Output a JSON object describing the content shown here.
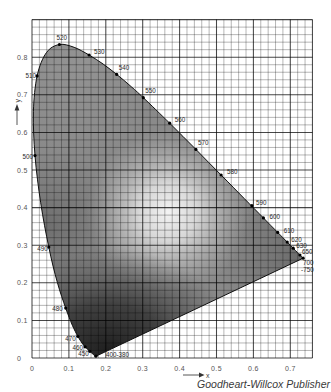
{
  "figure": {
    "credit": "Goodheart-Willcox Publisher"
  },
  "chart_data": {
    "type": "line",
    "title": "",
    "xlabel": "x",
    "ylabel": "y",
    "xlim": [
      0,
      0.76
    ],
    "ylim": [
      0,
      0.9
    ],
    "xticks": [
      0,
      0.1,
      0.2,
      0.3,
      0.4,
      0.5,
      0.6,
      0.7
    ],
    "xtick_labels": [
      "0",
      "0.1",
      "0.2",
      "0.3",
      "0.4",
      "0.5",
      "0.6",
      "0.7"
    ],
    "yticks": [
      0,
      0.1,
      0.2,
      0.3,
      0.4,
      0.5,
      0.6,
      0.7,
      0.8
    ],
    "ytick_labels": [
      "0",
      "0.1",
      "0.2",
      "0.3",
      "0.4",
      "0.5",
      "0.6",
      "0.7",
      "0.8"
    ],
    "grid": {
      "on": true,
      "minor_step": 0.02,
      "major_step": 0.1
    },
    "legend": null,
    "colors": {
      "fill_base": "#8a8a8a",
      "fill_light_center": "#f4f4f4",
      "fill_dark_bottom": "#1c1c1c",
      "locus_line": "#111111",
      "marker": "#000000",
      "background": "#ffffff"
    },
    "series": [
      {
        "name": "spectral locus",
        "closed": true,
        "wavelengths_nm": [
          380,
          420,
          430,
          440,
          450,
          455,
          460,
          465,
          470,
          475,
          480,
          485,
          490,
          495,
          500,
          505,
          510,
          515,
          520,
          525,
          530,
          535,
          540,
          545,
          550,
          560,
          570,
          580,
          590,
          600,
          610,
          620,
          630,
          640,
          650,
          700
        ],
        "x": [
          0.1741,
          0.1714,
          0.1689,
          0.1644,
          0.1566,
          0.151,
          0.144,
          0.1355,
          0.1241,
          0.1096,
          0.0913,
          0.0687,
          0.0454,
          0.0235,
          0.0082,
          0.0039,
          0.0139,
          0.0389,
          0.0743,
          0.1142,
          0.1547,
          0.1929,
          0.2296,
          0.2658,
          0.3016,
          0.3731,
          0.4441,
          0.5125,
          0.5752,
          0.627,
          0.6658,
          0.6915,
          0.7079,
          0.719,
          0.726,
          0.7347
        ],
        "y": [
          0.005,
          0.0051,
          0.0069,
          0.0109,
          0.0177,
          0.0227,
          0.0297,
          0.0399,
          0.0578,
          0.0868,
          0.1327,
          0.2007,
          0.295,
          0.4127,
          0.5384,
          0.6548,
          0.7502,
          0.812,
          0.8338,
          0.8262,
          0.8059,
          0.7816,
          0.7543,
          0.7243,
          0.6923,
          0.6245,
          0.5547,
          0.4866,
          0.4242,
          0.3725,
          0.334,
          0.3083,
          0.292,
          0.2809,
          0.274,
          0.2653
        ]
      }
    ],
    "markers": [
      {
        "label": "400-380",
        "x": 0.1733,
        "y": 0.0048,
        "dx": 10,
        "dy": 0.5,
        "anchor": "start"
      },
      {
        "label": "450",
        "x": 0.1566,
        "y": 0.0177,
        "dx": -1,
        "dy": 5,
        "anchor": "end"
      },
      {
        "label": "460",
        "x": 0.144,
        "y": 0.0297,
        "dx": -2,
        "dy": 3,
        "anchor": "end"
      },
      {
        "label": "470",
        "x": 0.1241,
        "y": 0.0578,
        "dx": -2,
        "dy": 5,
        "anchor": "end"
      },
      {
        "label": "480",
        "x": 0.0913,
        "y": 0.1327,
        "dx": -3,
        "dy": 3,
        "anchor": "end"
      },
      {
        "label": "490",
        "x": 0.0454,
        "y": 0.295,
        "dx": -1,
        "dy": 4,
        "anchor": "end"
      },
      {
        "label": "500",
        "x": 0.0082,
        "y": 0.5384,
        "dx": -2,
        "dy": 3.5,
        "anchor": "end"
      },
      {
        "label": "510",
        "x": 0.0139,
        "y": 0.7502,
        "dx": -1,
        "dy": 2,
        "anchor": "end"
      },
      {
        "label": "520",
        "x": 0.0743,
        "y": 0.8338,
        "dx": -3,
        "dy": -5,
        "anchor": "start"
      },
      {
        "label": "530",
        "x": 0.1547,
        "y": 0.8059,
        "dx": 5,
        "dy": -1,
        "anchor": "start"
      },
      {
        "label": "540",
        "x": 0.2296,
        "y": 0.7543,
        "dx": 2,
        "dy": -4,
        "anchor": "start"
      },
      {
        "label": "550",
        "x": 0.3016,
        "y": 0.6923,
        "dx": 2,
        "dy": -5,
        "anchor": "start"
      },
      {
        "label": "560",
        "x": 0.3731,
        "y": 0.6245,
        "dx": 5,
        "dy": -1,
        "anchor": "start"
      },
      {
        "label": "570",
        "x": 0.4441,
        "y": 0.5547,
        "dx": 2,
        "dy": -4,
        "anchor": "start"
      },
      {
        "label": "580",
        "x": 0.5125,
        "y": 0.4866,
        "dx": 6,
        "dy": -1,
        "anchor": "start"
      },
      {
        "label": "590",
        "x": 0.596,
        "y": 0.405,
        "dx": 4,
        "dy": -1,
        "anchor": "start"
      },
      {
        "label": "600",
        "x": 0.627,
        "y": 0.3725,
        "dx": 6,
        "dy": 1,
        "anchor": "start"
      },
      {
        "label": "610",
        "x": 0.6658,
        "y": 0.334,
        "dx": 6,
        "dy": 1,
        "anchor": "start"
      },
      {
        "label": "620",
        "x": 0.6915,
        "y": 0.3083,
        "dx": 4,
        "dy": 0,
        "anchor": "start"
      },
      {
        "label": "630",
        "x": 0.7079,
        "y": 0.292,
        "dx": 3,
        "dy": 0,
        "anchor": "start"
      },
      {
        "label": "650",
        "x": 0.726,
        "y": 0.274,
        "dx": 2,
        "dy": -1.5,
        "anchor": "start"
      },
      {
        "label": "700\n-750",
        "x": 0.7347,
        "y": 0.2653,
        "dx": 0,
        "dy": 7,
        "anchor": "start"
      }
    ]
  }
}
